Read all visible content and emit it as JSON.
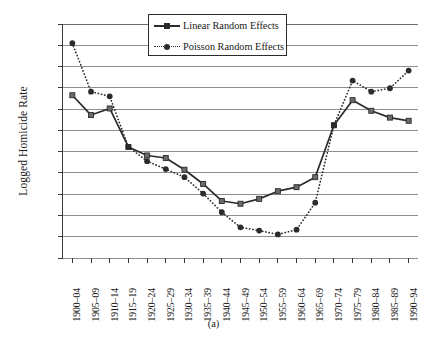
{
  "chart_data": {
    "type": "line",
    "title": "",
    "caption": "(a)",
    "xlabel": "",
    "ylabel": "Logged Homicide Rate",
    "ylim": [
      -0.5,
      0.6
    ],
    "yticks": [
      0.6,
      0.5,
      0.4,
      0.3,
      0.2,
      0.1,
      0,
      -0.1,
      -0.2,
      -0.3,
      -0.4,
      -0.5
    ],
    "ytick_labels": [
      "0.6",
      "0.5",
      "0.4",
      "0.3",
      "0.2",
      "0.1",
      "0",
      "–0.1",
      "–0.2",
      "–0.3",
      "–0.4",
      "–0.5"
    ],
    "grid": true,
    "legend_position": "top-center",
    "categories": [
      "1900–04",
      "1905–09",
      "1910–14",
      "1915–19",
      "1920–24",
      "1925–29",
      "1930–34",
      "1935–39",
      "1940–44",
      "1945–49",
      "1950–54",
      "1955–59",
      "1960–64",
      "1965–69",
      "1970–74",
      "1975–79",
      "1980–84",
      "1985–89",
      "1990–94"
    ],
    "series": [
      {
        "name": "Linear Random Effects",
        "style": "solid",
        "marker": "square",
        "color": "#2b2b2b",
        "values": [
          0.265,
          0.172,
          0.203,
          0.022,
          -0.018,
          -0.03,
          -0.085,
          -0.152,
          -0.232,
          -0.245,
          -0.222,
          -0.186,
          -0.167,
          -0.12,
          0.124,
          0.242,
          0.192,
          0.16,
          0.145
        ]
      },
      {
        "name": "Poisson Random Effects",
        "style": "dotted",
        "marker": "circle",
        "color": "#2b2b2b",
        "values": [
          0.51,
          0.282,
          0.26,
          0.022,
          -0.045,
          -0.082,
          -0.12,
          -0.197,
          -0.285,
          -0.356,
          -0.371,
          -0.389,
          -0.367,
          -0.24,
          0.124,
          0.334,
          0.282,
          0.298,
          0.381
        ]
      }
    ]
  }
}
